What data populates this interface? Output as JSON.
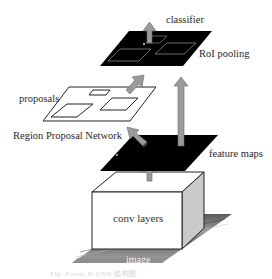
{
  "diagram": {
    "type": "Faster R-CNN architecture",
    "labels": {
      "classifier": "classifier",
      "roi_pooling": "RoI pooling",
      "proposals": "proposals",
      "rpn": "Region Proposal Network",
      "feature_maps": "feature maps",
      "conv_layers": "conv layers",
      "image": "image"
    },
    "caption": "Fig.  Faster R-CNN 结构图",
    "colors": {
      "plane_dark": "#000000",
      "arrow_fill": "#9a9a9a",
      "arrow_stroke": "#6a6a6a",
      "box_face": "#ffffff",
      "box_side": "#c8c8c8",
      "image_plane": "#7a7a7a"
    },
    "nodes": [
      {
        "id": "image",
        "label": "image"
      },
      {
        "id": "conv",
        "label": "conv layers"
      },
      {
        "id": "feature_maps",
        "label": "feature maps"
      },
      {
        "id": "rpn",
        "label": "Region Proposal Network"
      },
      {
        "id": "proposals",
        "label": "proposals"
      },
      {
        "id": "roi_pooling",
        "label": "RoI pooling"
      },
      {
        "id": "classifier",
        "label": "classifier"
      }
    ],
    "edges": [
      {
        "from": "conv",
        "to": "feature_maps"
      },
      {
        "from": "feature_maps",
        "to": "proposals",
        "via": "rpn"
      },
      {
        "from": "proposals",
        "to": "roi_pooling"
      },
      {
        "from": "feature_maps",
        "to": "roi_pooling"
      },
      {
        "from": "roi_pooling",
        "to": "classifier"
      }
    ]
  }
}
